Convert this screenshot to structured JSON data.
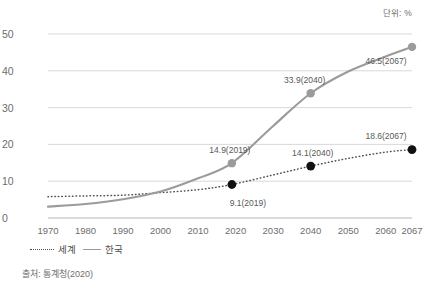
{
  "unit_note": "단위: %",
  "source_note": "출처: 통계청(2020)",
  "legend": {
    "world_label": "세계",
    "korea_label": "한국"
  },
  "colors": {
    "world_line": "#4f4f4f",
    "korea_line": "#9b9b9b",
    "world_marker": "#111111",
    "korea_marker": "#9b9b9b",
    "grid": "#d9d9d9",
    "text": "#6d6d6d"
  },
  "chart_data": {
    "type": "line",
    "title": "",
    "subtitle": "",
    "xlabel": "",
    "ylabel": "",
    "unit": "단위: %",
    "xlim": [
      1970,
      2067
    ],
    "ylim": [
      0,
      50
    ],
    "grid": "horizontal",
    "legend_position": "bottom-left",
    "xticks": [
      1970,
      1980,
      1990,
      2000,
      2010,
      2020,
      2030,
      2040,
      2050,
      2060,
      2067
    ],
    "xtick_labels": [
      "1970",
      "1980",
      "1990",
      "2000",
      "2010",
      "2020",
      "2030",
      "2040",
      "2050",
      "2060",
      "2067"
    ],
    "yticks": [
      0,
      10,
      20,
      30,
      40,
      50
    ],
    "ytick_labels": [
      "0",
      "10",
      "20",
      "30",
      "40",
      "50"
    ],
    "series": [
      {
        "name": "세계",
        "style": "dotted",
        "x": [
          1970,
          1980,
          1990,
          2000,
          2010,
          2019,
          2030,
          2040,
          2050,
          2060,
          2067
        ],
        "values": [
          5.8,
          6.0,
          6.2,
          6.9,
          7.7,
          9.1,
          11.7,
          14.1,
          16.2,
          17.9,
          18.6
        ]
      },
      {
        "name": "한국",
        "style": "solid",
        "x": [
          1970,
          1980,
          1990,
          2000,
          2010,
          2019,
          2030,
          2040,
          2050,
          2060,
          2067
        ],
        "values": [
          3.1,
          3.8,
          5.1,
          7.2,
          10.8,
          14.9,
          25.0,
          33.9,
          39.8,
          43.9,
          46.5
        ]
      }
    ],
    "annotations": [
      {
        "text": "14.9(2019)",
        "series": "한국",
        "x": 2019,
        "y": 14.9,
        "dx": -2,
        "dy": -13
      },
      {
        "text": "33.9(2040)",
        "series": "한국",
        "x": 2040,
        "y": 33.9,
        "dx": -6,
        "dy": -13
      },
      {
        "text": "46.5(2067)",
        "series": "한국",
        "x": 2067,
        "y": 46.5,
        "dx": -26,
        "dy": 14
      },
      {
        "text": "9.1(2019)",
        "series": "세계",
        "x": 2019,
        "y": 9.1,
        "dx": 16,
        "dy": 18
      },
      {
        "text": "14.1(2040)",
        "series": "세계",
        "x": 2040,
        "y": 14.1,
        "dx": 2,
        "dy": -13
      },
      {
        "text": "18.6(2067)",
        "series": "세계",
        "x": 2067,
        "y": 18.6,
        "dx": -26,
        "dy": -14
      }
    ],
    "markers": [
      {
        "series": "한국",
        "x": 2019,
        "y": 14.9
      },
      {
        "series": "한국",
        "x": 2040,
        "y": 33.9
      },
      {
        "series": "한국",
        "x": 2067,
        "y": 46.5
      },
      {
        "series": "세계",
        "x": 2019,
        "y": 9.1
      },
      {
        "series": "세계",
        "x": 2040,
        "y": 14.1
      },
      {
        "series": "세계",
        "x": 2067,
        "y": 18.6
      }
    ]
  }
}
